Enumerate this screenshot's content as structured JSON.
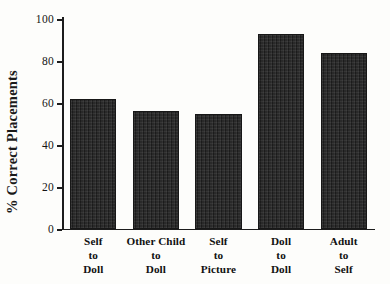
{
  "chart_data": {
    "type": "bar",
    "title": "",
    "xlabel": "",
    "ylabel": "% Correct Placements",
    "ylim": [
      0,
      100
    ],
    "yticks": [
      0,
      20,
      40,
      60,
      80,
      100
    ],
    "ytick_labels": [
      "0",
      "20",
      "40",
      "60",
      "80",
      "100"
    ],
    "grid": false,
    "legend": null,
    "categories": [
      "Self to Doll",
      "Other Child to Doll",
      "Self to Picture",
      "Doll to Doll",
      "Adult to Self"
    ],
    "category_label_lines": [
      [
        "Self",
        "to",
        "Doll"
      ],
      [
        "Other Child",
        "to",
        "Doll"
      ],
      [
        "Self",
        "to",
        "Picture"
      ],
      [
        "Doll",
        "to",
        "Doll"
      ],
      [
        "Adult",
        "to",
        "Self"
      ]
    ],
    "values": [
      62,
      56,
      55,
      93,
      84
    ],
    "bar_color": "#262626",
    "axis_color": "#1c1c1c",
    "background_color": "#fdfdfb"
  }
}
